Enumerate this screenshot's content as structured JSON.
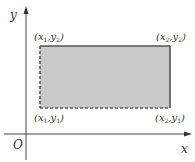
{
  "diagram": {
    "axes": {
      "x_label": "x",
      "y_label": "y",
      "origin_label": "O"
    },
    "rectangle": {
      "fill_color": "#c9c9c9",
      "edge_color": "#444444",
      "solid_edges": [
        "top",
        "right"
      ],
      "dashed_edges": [
        "left",
        "bottom"
      ],
      "corners": {
        "top_left": {
          "x": "x",
          "xsub": "1",
          "y": "y",
          "ysub": "2"
        },
        "top_right": {
          "x": "x",
          "xsub": "2",
          "y": "y",
          "ysub": "2"
        },
        "bottom_left": {
          "x": "x",
          "xsub": "1",
          "y": "y",
          "ysub": "1"
        },
        "bottom_right": {
          "x": "x",
          "xsub": "2",
          "y": "y",
          "ysub": "1"
        }
      }
    }
  }
}
